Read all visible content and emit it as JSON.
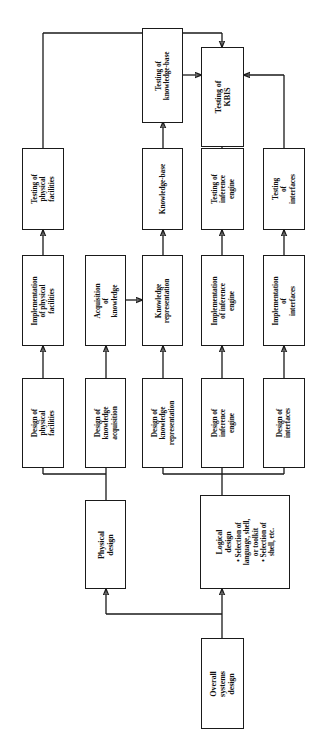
{
  "diagram": {
    "orientation": "rotated-90",
    "accent_color": "#1a1a1a",
    "background": "#ffffff"
  },
  "nodes": {
    "overall_systems_design": {
      "lines": [
        "Overall",
        "systems",
        "design"
      ]
    },
    "physical_design": {
      "lines": [
        "Physical",
        "design"
      ]
    },
    "logical_design": {
      "lines": [
        "Logical",
        "design"
      ],
      "bullets": [
        "• Selection of",
        "   language, shell,",
        "   or toolkit",
        "• Selection of",
        "   shell, etc."
      ]
    },
    "design_physical_facilities": {
      "lines": [
        "Design of",
        "physical",
        "facilities"
      ]
    },
    "design_knowledge_acquisition": {
      "lines": [
        "Design of",
        "knowledge",
        "acquisition"
      ]
    },
    "design_knowledge_representation": {
      "lines": [
        "Design of",
        "knowledge",
        "representation"
      ]
    },
    "design_inference_engine": {
      "lines": [
        "Design of",
        "inference",
        "engine"
      ]
    },
    "design_interfaces": {
      "lines": [
        "Design of",
        "interfaces"
      ]
    },
    "implementation_physical_facilities": {
      "lines": [
        "Implementation",
        "of physical",
        "facilities"
      ]
    },
    "acquisition_of_knowledge": {
      "lines": [
        "Acquisition",
        "of",
        "knowledge"
      ]
    },
    "knowledge_representation": {
      "lines": [
        "Knowledge",
        "representation"
      ]
    },
    "implementation_inference_engine": {
      "lines": [
        "Implementation",
        "of inference",
        "engine"
      ]
    },
    "implementation_interfaces": {
      "lines": [
        "Implementation",
        "of",
        "interfaces"
      ]
    },
    "testing_physical_facilities": {
      "lines": [
        "Testing of",
        "physical",
        "facilities"
      ]
    },
    "knowledge_base": {
      "lines": [
        "Knowledge-base"
      ]
    },
    "testing_inference_engine": {
      "lines": [
        "Testing of",
        "inference",
        "engine"
      ]
    },
    "testing_interfaces": {
      "lines": [
        "Testing",
        "of",
        "interfaces"
      ]
    },
    "testing_knowledge_base": {
      "lines": [
        "Testing of",
        "knowledge-base"
      ]
    },
    "testing_kbis": {
      "lines": [
        "Testing of",
        "KBIS"
      ]
    }
  },
  "edges": [
    {
      "from": "overall_systems_design",
      "to": "physical_design"
    },
    {
      "from": "overall_systems_design",
      "to": "logical_design"
    },
    {
      "from": "physical_design",
      "to": "design_physical_facilities"
    },
    {
      "from": "physical_design",
      "to": "design_knowledge_acquisition"
    },
    {
      "from": "logical_design",
      "to": "design_knowledge_representation"
    },
    {
      "from": "logical_design",
      "to": "design_inference_engine"
    },
    {
      "from": "logical_design",
      "to": "design_interfaces"
    },
    {
      "from": "design_physical_facilities",
      "to": "implementation_physical_facilities"
    },
    {
      "from": "design_knowledge_acquisition",
      "to": "acquisition_of_knowledge"
    },
    {
      "from": "design_knowledge_representation",
      "to": "knowledge_representation"
    },
    {
      "from": "design_inference_engine",
      "to": "implementation_inference_engine"
    },
    {
      "from": "design_interfaces",
      "to": "implementation_interfaces"
    },
    {
      "from": "implementation_physical_facilities",
      "to": "testing_physical_facilities"
    },
    {
      "from": "acquisition_of_knowledge",
      "to": "knowledge_representation"
    },
    {
      "from": "knowledge_representation",
      "to": "knowledge_base"
    },
    {
      "from": "implementation_inference_engine",
      "to": "testing_inference_engine"
    },
    {
      "from": "implementation_interfaces",
      "to": "testing_interfaces"
    },
    {
      "from": "knowledge_base",
      "to": "testing_knowledge_base"
    },
    {
      "from": "testing_knowledge_base",
      "to": "testing_kbis"
    },
    {
      "from": "testing_inference_engine",
      "to": "testing_kbis"
    },
    {
      "from": "testing_interfaces",
      "to": "testing_kbis"
    },
    {
      "from": "testing_physical_facilities",
      "to": "testing_kbis"
    }
  ]
}
